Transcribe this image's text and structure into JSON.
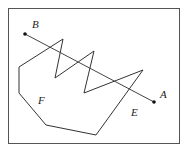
{
  "diagram": {
    "type": "geometry-figure",
    "points": {
      "A": {
        "label": "A"
      },
      "B": {
        "label": "B"
      }
    },
    "regions": {
      "E": {
        "label": "E"
      },
      "F": {
        "label": "F"
      }
    },
    "segment": {
      "from": "B",
      "to": "A"
    }
  }
}
